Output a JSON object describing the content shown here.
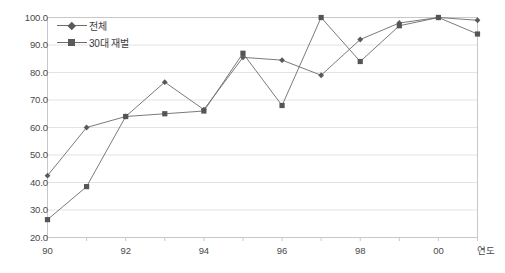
{
  "chart_data": {
    "type": "line",
    "title": "",
    "xlabel": "연도",
    "ylabel": "",
    "ylim": [
      20,
      100
    ],
    "ytick_step": 10,
    "ytick_labels": [
      "100.0",
      "90.0",
      "80.0",
      "70.0",
      "60.0",
      "50.0",
      "40.0",
      "30.0",
      "20.0"
    ],
    "ytick_values": [
      100,
      90,
      80,
      70,
      60,
      50,
      40,
      30,
      20
    ],
    "x": [
      90,
      91,
      92,
      93,
      94,
      95,
      96,
      97,
      98,
      99,
      0,
      1
    ],
    "xtick_labels": [
      "90",
      "",
      "92",
      "",
      "94",
      "",
      "96",
      "",
      "98",
      "",
      "00",
      ""
    ],
    "categories": [
      "90",
      "91",
      "92",
      "93",
      "94",
      "95",
      "96",
      "97",
      "98",
      "99",
      "00",
      "01"
    ],
    "grid": true,
    "grid_axis": "y",
    "legend_position": "top-left",
    "series": [
      {
        "name": "전체",
        "marker": "diamond",
        "color": "#5a5a5a",
        "values": [
          42.5,
          60.0,
          64.0,
          76.5,
          66.5,
          85.5,
          84.5,
          79.0,
          92.0,
          98.0,
          100.0,
          99.0
        ]
      },
      {
        "name": "30대 재벌",
        "marker": "square",
        "color": "#555555",
        "values": [
          26.5,
          38.5,
          64.0,
          65.0,
          66.0,
          87.0,
          68.0,
          100.0,
          84.0,
          97.0,
          100.0,
          94.0
        ]
      }
    ]
  },
  "axis": {
    "x_title": "연도"
  },
  "colors": {
    "grid": "#e3e3e7",
    "border": "#c8c8cc",
    "line": "#6b6b6b",
    "text": "#4a4a4a",
    "background": "#ffffff"
  }
}
